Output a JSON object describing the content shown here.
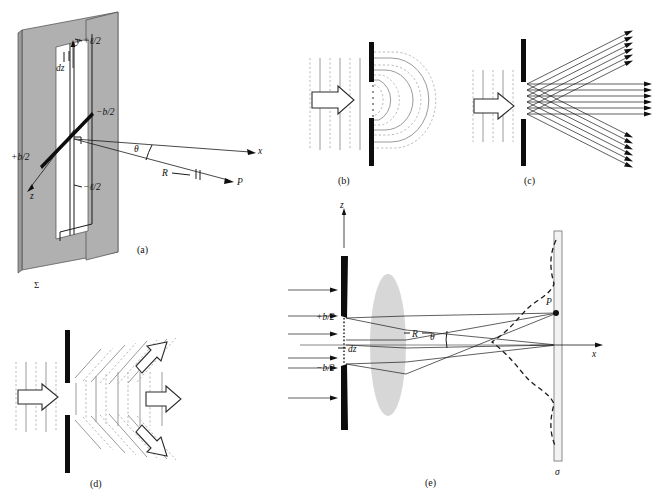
{
  "figure": {
    "panels": [
      {
        "id": "a",
        "caption": "(a)",
        "description": "single-slit-aperture-3d-geometry",
        "labels": {
          "y_axis": "y",
          "z_axis": "z",
          "x_axis": "x",
          "l_plus": "+ℓ/2",
          "l_minus": "−ℓ/2",
          "b_plus": "+b/2",
          "b_minus": "−b/2",
          "dz": "dz",
          "theta": "θ",
          "R": "R",
          "P": "P",
          "sigma": "Σ"
        }
      },
      {
        "id": "b",
        "caption": "(b)",
        "description": "huygens-wavelets-spreading-from-slit",
        "labels": {}
      },
      {
        "id": "c",
        "caption": "(c)",
        "description": "ray-bundles-leaving-slit-at-three-angles",
        "labels": {}
      },
      {
        "id": "d",
        "caption": "(d)",
        "description": "three-diffracted-plane-wave-bundles-with-block-arrows",
        "labels": {}
      },
      {
        "id": "e",
        "caption": "(e)",
        "description": "fraunhofer-single-slit-with-lens-and-irradiance-curve",
        "labels": {
          "z_axis": "z",
          "x_axis": "x",
          "b_plus": "+b/2",
          "b_minus": "−b/2",
          "dz": "dz",
          "R": "R",
          "theta": "θ",
          "P": "P",
          "sigma": "σ"
        }
      }
    ]
  },
  "colors": {
    "background": "#ffffff",
    "ink": "#111111",
    "aperture_plane": "#b0b0b0",
    "opaque_bar": "#0d0d0d",
    "wavefront_solid": "#9a9a9a",
    "wavefront_dashed": "#b9b9b9",
    "lens": "#c9c9c9",
    "screen": "#f2f2f2"
  }
}
